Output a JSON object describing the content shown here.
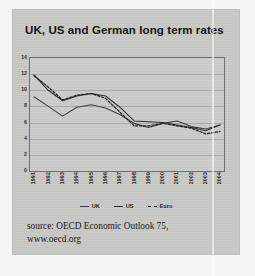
{
  "card": {
    "title": "UK, US and German long term rates",
    "background_color": "#c9c9c7",
    "page_background_color": "#f4f4f2"
  },
  "source": {
    "line1": "source: OECD Economic Outlook 75,",
    "line2": "www.oecd.org"
  },
  "legend": {
    "position": "bottom-center",
    "items": [
      {
        "label": "UK",
        "style": "solid",
        "color": "#3d3d3b"
      },
      {
        "label": "US",
        "style": "solid",
        "color": "#2a2a28"
      },
      {
        "label": "Euro",
        "style": "dashed",
        "color": "#1f1f1d"
      }
    ]
  },
  "chart_data": {
    "type": "line",
    "title": "UK, US and German long term rates",
    "xlabel": "",
    "ylabel": "",
    "grid": true,
    "ylim": [
      0,
      14
    ],
    "yticks": [
      0,
      2,
      4,
      6,
      8,
      10,
      12,
      14
    ],
    "ytick_labels": [
      "0",
      "2",
      "4",
      "6",
      "8",
      "10",
      "12",
      "14"
    ],
    "categories": [
      "1991",
      "1992",
      "1993",
      "1994",
      "1995",
      "1996",
      "1997",
      "1998",
      "1999",
      "2000",
      "2001",
      "2002",
      "2003",
      "2004"
    ],
    "series": [
      {
        "name": "UK",
        "style": "solid",
        "color": "#3d3d3b",
        "values": [
          9.2,
          8.0,
          6.8,
          7.9,
          8.2,
          7.8,
          7.0,
          5.9,
          5.4,
          5.9,
          6.2,
          5.5,
          5.2,
          5.7
        ]
      },
      {
        "name": "US",
        "style": "solid",
        "color": "#2a2a28",
        "values": [
          11.9,
          10.0,
          8.7,
          9.3,
          9.6,
          9.3,
          7.9,
          6.2,
          6.1,
          6.0,
          5.7,
          5.4,
          5.0,
          5.7
        ]
      },
      {
        "name": "Euro",
        "style": "dashed",
        "color": "#1f1f1d",
        "values": [
          11.8,
          10.4,
          8.8,
          9.4,
          9.6,
          9.0,
          7.3,
          5.6,
          5.6,
          5.9,
          5.6,
          5.3,
          4.6,
          4.9
        ]
      }
    ]
  }
}
